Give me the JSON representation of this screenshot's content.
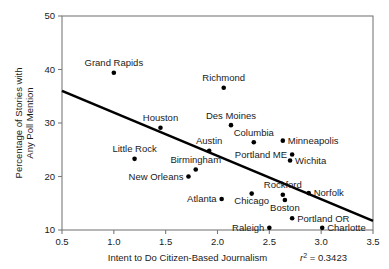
{
  "chart_data": {
    "type": "scatter",
    "title": "",
    "xlabel": "Intent to Do Citizen-Based Journalism",
    "ylabel": "Percentage of Stories with Any Poll Mention",
    "ylabel_line1": "Percentage of Stories with",
    "ylabel_line2": "Any Poll Mention",
    "xlim": [
      0.5,
      3.5
    ],
    "ylim": [
      10,
      50
    ],
    "xticks": [
      "0.5",
      "1.0",
      "1.5",
      "2.0",
      "2.5",
      "3.0",
      "3.5"
    ],
    "xtick_values": [
      0.5,
      1.0,
      1.5,
      2.0,
      2.5,
      3.0,
      3.5
    ],
    "yticks": [
      "10",
      "20",
      "30",
      "40",
      "50"
    ],
    "ytick_values": [
      10,
      20,
      30,
      40,
      50
    ],
    "grid": false,
    "legend": "none",
    "annotation_r2_prefix": "r",
    "annotation_r2_exponent": "2",
    "annotation_r2_value": "= 0.3423",
    "annotation_r2_full": "r2 = 0.3423",
    "point_color": "#000000",
    "line_color": "#000000",
    "axis_color": "#7a7a7a",
    "fit_line": {
      "x": [
        0.5,
        3.5
      ],
      "y": [
        36.0,
        11.7
      ],
      "label": "regression line"
    },
    "points": [
      {
        "label": "Grand Rapids",
        "x": 1.0,
        "y": 39.4,
        "label_pos": "above"
      },
      {
        "label": "Richmond",
        "x": 2.06,
        "y": 36.6,
        "label_pos": "above"
      },
      {
        "label": "Houston",
        "x": 1.45,
        "y": 29.1,
        "label_pos": "above"
      },
      {
        "label": "Des Moines",
        "x": 2.13,
        "y": 29.6,
        "label_pos": "above"
      },
      {
        "label": "Columbia",
        "x": 2.35,
        "y": 26.4,
        "label_pos": "above"
      },
      {
        "label": "Minneapolis",
        "x": 2.63,
        "y": 26.7,
        "label_pos": "right"
      },
      {
        "label": "Austin",
        "x": 1.92,
        "y": 24.8,
        "label_pos": "above"
      },
      {
        "label": "Portland ME",
        "x": 2.72,
        "y": 24.1,
        "label_pos": "left"
      },
      {
        "label": "Wichita",
        "x": 2.7,
        "y": 23.0,
        "label_pos": "right"
      },
      {
        "label": "Little Rock",
        "x": 1.2,
        "y": 23.3,
        "label_pos": "above"
      },
      {
        "label": "Birmingham",
        "x": 1.79,
        "y": 21.3,
        "label_pos": "above"
      },
      {
        "label": "New Orleans",
        "x": 1.72,
        "y": 20.0,
        "label_pos": "left"
      },
      {
        "label": "Rockford",
        "x": 2.63,
        "y": 16.6,
        "label_pos": "above"
      },
      {
        "label": "Norfolk",
        "x": 2.88,
        "y": 16.9,
        "label_pos": "right"
      },
      {
        "label": "Chicago",
        "x": 2.33,
        "y": 16.8,
        "label_pos": "below"
      },
      {
        "label": "Atlanta",
        "x": 2.04,
        "y": 15.8,
        "label_pos": "left"
      },
      {
        "label": "Boston",
        "x": 2.65,
        "y": 15.6,
        "label_pos": "below"
      },
      {
        "label": "Portland OR",
        "x": 2.72,
        "y": 12.2,
        "label_pos": "right"
      },
      {
        "label": "Raleigh",
        "x": 2.5,
        "y": 10.4,
        "label_pos": "left"
      },
      {
        "label": "Charlotte",
        "x": 3.01,
        "y": 10.4,
        "label_pos": "right"
      }
    ]
  }
}
